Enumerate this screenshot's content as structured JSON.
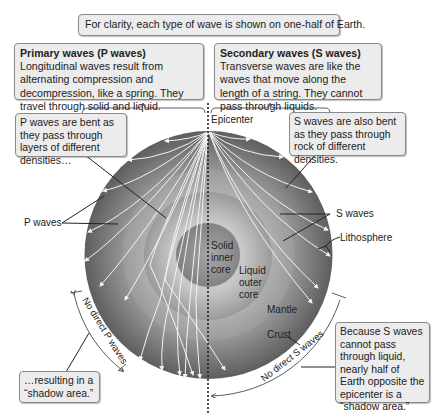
{
  "header_note": "For clarity, each type of wave is shown on one-half of Earth.",
  "p_wave_box": {
    "title": "Primary waves (P waves)",
    "body": "Longitudinal waves result from alternating compression and decompression, like a spring. They travel through solid and liquid."
  },
  "s_wave_box": {
    "title": "Secondary waves (S waves)",
    "body": "Transverse waves are like the waves that move along the length of a string. They cannot pass through liquids."
  },
  "callouts": {
    "p_bent": "P waves are bent as they pass through layers of different densities…",
    "s_bent": "S waves are also bent as they pass through rock of different densities.",
    "p_shadow": "…resulting in a “shadow area.”",
    "s_shadow": "Because S waves cannot pass through liquid, nearly half of Earth opposite the epicenter is a “shadow area.”"
  },
  "labels": {
    "epicenter": "Epicenter",
    "p_waves": "P waves",
    "s_waves": "S waves",
    "lithosphere": "Lithosphere",
    "inner_core": "Solid inner core",
    "outer_core": "Liquid outer core",
    "mantle": "Mantle",
    "crust": "Crust",
    "no_direct_p": "No direct P waves",
    "no_direct_s": "No direct S waves"
  },
  "colors": {
    "mantle": "#707070",
    "outer_core": "#b5b5b5",
    "inner_core": "#8e8e8e",
    "box_fill": "#ececec",
    "wave_line": "#f4f4f4"
  }
}
